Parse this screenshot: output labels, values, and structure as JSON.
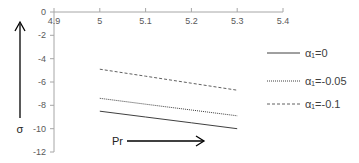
{
  "chart_data": {
    "type": "line",
    "title": "",
    "xlabel": "Pr",
    "ylabel": "σ",
    "xlim": [
      4.9,
      5.4
    ],
    "ylim": [
      -12,
      0
    ],
    "x_ticks": [
      "4.9",
      "5",
      "5.1",
      "5.2",
      "5.3",
      "5.4"
    ],
    "y_ticks": [
      "0",
      "-2",
      "-4",
      "-6",
      "-8",
      "-10",
      "-12"
    ],
    "grid": false,
    "legend_position": "right",
    "x": [
      5.0,
      5.1,
      5.2,
      5.3
    ],
    "series": [
      {
        "name": "α₁=0",
        "style": "solid",
        "values": [
          -8.5,
          -9.0,
          -9.5,
          -10.0
        ]
      },
      {
        "name": "α₁=-0.05",
        "style": "dotted",
        "values": [
          -7.4,
          -7.9,
          -8.4,
          -8.9
        ]
      },
      {
        "name": "α₁=-0.1",
        "style": "dashed",
        "values": [
          -4.9,
          -5.5,
          -6.1,
          -6.7
        ]
      }
    ],
    "annotations": [
      {
        "text": "σ",
        "type": "arrow-up",
        "position": "left of y-axis"
      },
      {
        "text": "Pr",
        "type": "arrow-right",
        "position": "bottom inside plot"
      }
    ]
  },
  "legend": [
    {
      "label": "α₁=0"
    },
    {
      "label": "α₁=-0.05"
    },
    {
      "label": "α₁=-0.1"
    }
  ],
  "axis": {
    "x_ticks": [
      "4.9",
      "5",
      "5.1",
      "5.2",
      "5.3",
      "5.4"
    ],
    "y_ticks": [
      "0",
      "-2",
      "-4",
      "-6",
      "-8",
      "-10",
      "-12"
    ],
    "sigma_label": "σ",
    "pr_label": "Pr"
  }
}
